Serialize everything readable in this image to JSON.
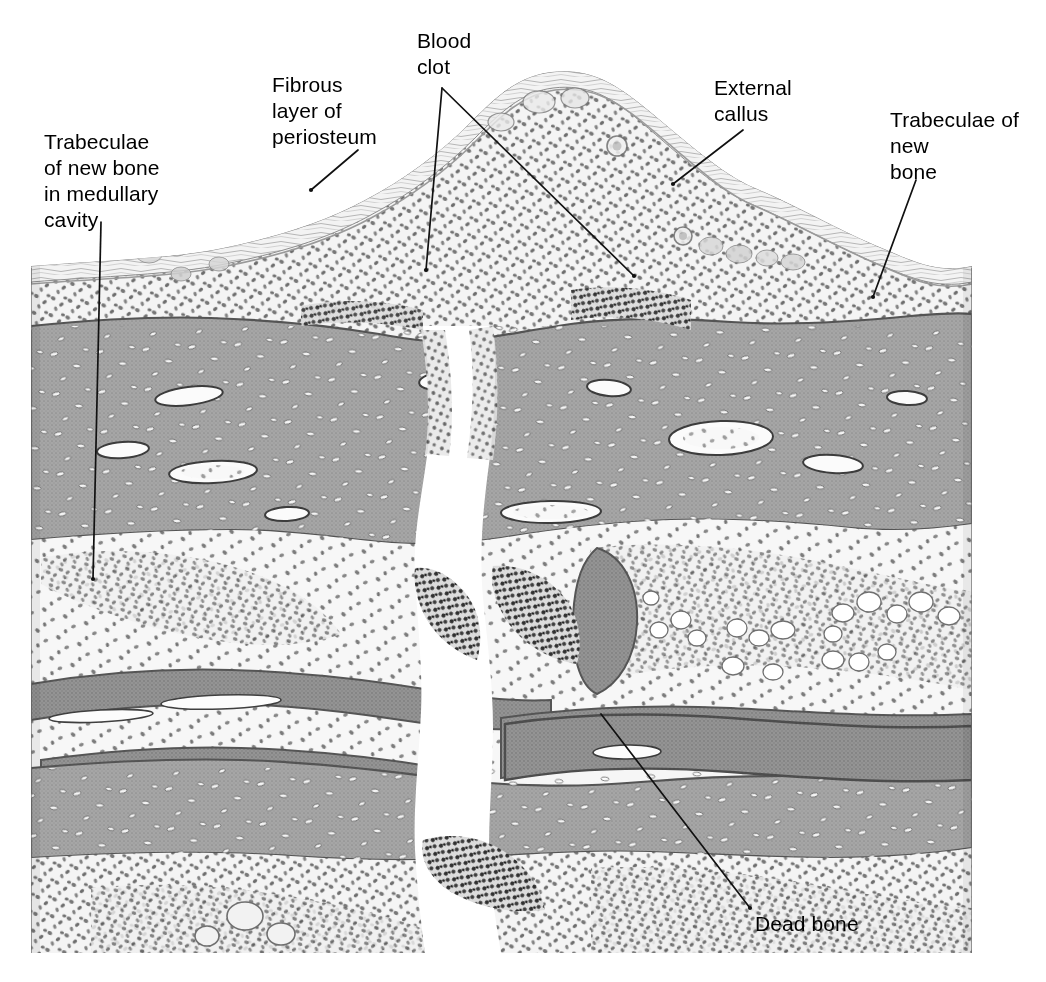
{
  "figure": {
    "width": 1046,
    "height": 982,
    "background_color": "#ffffff",
    "style": "grayscale pen-and-ink / halftone medical illustration"
  },
  "labels": [
    {
      "id": "trabeculae-medullary",
      "text": "Trabeculae\nof new bone\nin medullary\ncavity",
      "lines": [
        "Trabeculae",
        "of new bone",
        "in medullary",
        "cavity"
      ],
      "x": 44,
      "y": 129,
      "align": "left",
      "leaders": [
        {
          "x1": 101,
          "y1": 222,
          "x2": 93,
          "y2": 579
        }
      ]
    },
    {
      "id": "fibrous-periosteum",
      "text": "Fibrous\nlayer of\nperiosteum",
      "lines": [
        "Fibrous",
        "layer of",
        "periosteum"
      ],
      "x": 272,
      "y": 72,
      "align": "left",
      "leaders": [
        {
          "x1": 358,
          "y1": 150,
          "x2": 311,
          "y2": 190
        }
      ]
    },
    {
      "id": "blood-clot",
      "text": "Blood\nclot",
      "lines": [
        "Blood",
        "clot"
      ],
      "x": 417,
      "y": 28,
      "align": "left",
      "leaders": [
        {
          "x1": 442,
          "y1": 88,
          "x2": 426,
          "y2": 270
        },
        {
          "x1": 442,
          "y1": 88,
          "x2": 634,
          "y2": 276
        }
      ]
    },
    {
      "id": "external-callus",
      "text": "External\ncallus",
      "lines": [
        "External",
        "callus"
      ],
      "x": 714,
      "y": 75,
      "align": "left",
      "leaders": [
        {
          "x1": 743,
          "y1": 130,
          "x2": 673,
          "y2": 184
        }
      ]
    },
    {
      "id": "trabeculae-new-bone",
      "text": "Trabeculae of\nnew\nbone",
      "lines": [
        "Trabeculae of",
        "new",
        "bone"
      ],
      "x": 890,
      "y": 107,
      "align": "left",
      "leaders": [
        {
          "x1": 916,
          "y1": 180,
          "x2": 873,
          "y2": 297
        }
      ]
    },
    {
      "id": "dead-bone",
      "text": "Dead bone",
      "lines": [
        "Dead bone"
      ],
      "x": 755,
      "y": 911,
      "align": "left",
      "leaders": [
        {
          "x1": 601,
          "y1": 714,
          "x2": 750,
          "y2": 908
        }
      ]
    }
  ],
  "palette": {
    "ink": "#000000",
    "paper": "#ffffff",
    "cortical_bone": "#a3a3a3",
    "cortical_bone_dark": "#8d8d8d",
    "cortical_outline": "#4a4a4a",
    "lacuna_fill": "#ffffff",
    "lacuna_outline": "#5e5e5e",
    "callus_light": "#f2f2f2",
    "callus_tint": "#e2e2e2",
    "marrow_tint": "#ededed",
    "cell_nucleus": "#6e6e6e",
    "cell_nucleus_dark": "#3f3f3f",
    "clot_dark": "#3a3a3a",
    "fat_cell": "#ffffff",
    "vessel_outline": "#6a6a6a",
    "leader_line": "#111111"
  },
  "regions": [
    {
      "id": "external-callus-mound",
      "name": "External callus",
      "description": "Raised dome of spongy new bone and cellular tissue capping the fracture site",
      "tone": "light stippled"
    },
    {
      "id": "fibrous-periosteum-layer",
      "name": "Fibrous layer of periosteum",
      "description": "Thin fibrous sheet covering the outer surface of the callus",
      "tone": "pale wavy bands"
    },
    {
      "id": "cortical-bone-upper",
      "name": "Upper cortical bone",
      "description": "Dense compact bone band with osteocyte lacunae and vascular canals",
      "tone": "mid gray"
    },
    {
      "id": "cortical-bone-lower",
      "name": "Lower cortical bone",
      "description": "Dense compact bone band on the far side of the medullary cavity",
      "tone": "mid gray"
    },
    {
      "id": "medullary-cavity",
      "name": "Medullary cavity",
      "description": "Marrow space containing trabeculae of new bone and fat cells",
      "tone": "light with nuclei and clear fat vacuoles"
    },
    {
      "id": "fracture-gap",
      "name": "Fracture gap",
      "description": "Vertical cleft running through both cortices filled with blood clot",
      "tone": "white with dark clot margins"
    },
    {
      "id": "blood-clot-zone",
      "name": "Blood clot",
      "description": "Dark granular coagulum along the fracture margins",
      "tone": "dark stipple"
    },
    {
      "id": "dead-bone-fragment",
      "name": "Dead bone",
      "description": "Necrotic cortical fragment near the lower fracture margin",
      "tone": "mid gray plate"
    }
  ]
}
